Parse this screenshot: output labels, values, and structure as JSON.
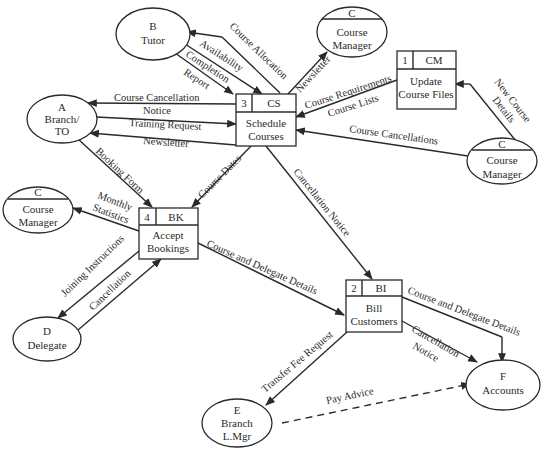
{
  "diagram": {
    "type": "data-flow-diagram",
    "colors": {
      "stroke": "#2a2a2a",
      "text": "#2a2a2a",
      "background": "#ffffff"
    },
    "processes": [
      {
        "id": "p1",
        "number": "1",
        "code": "CM",
        "line1": "Update",
        "line2": "Course Files"
      },
      {
        "id": "p2",
        "number": "2",
        "code": "BI",
        "line1": "Bill",
        "line2": "Customers"
      },
      {
        "id": "p3",
        "number": "3",
        "code": "CS",
        "line1": "Schedule",
        "line2": "Courses"
      },
      {
        "id": "p4",
        "number": "4",
        "code": "BK",
        "line1": "Accept",
        "line2": "Bookings"
      }
    ],
    "entities": {
      "tutor": {
        "letter": "B",
        "line1": "Tutor"
      },
      "branch_to": {
        "letter": "A",
        "line1": "Branch/",
        "line2": "TO"
      },
      "course_manager_top": {
        "letter": "C",
        "line1": "Course",
        "line2": "Manager"
      },
      "course_manager_right": {
        "letter": "C",
        "line1": "Course",
        "line2": "Manager"
      },
      "course_manager_left": {
        "letter": "C",
        "line1": "Course",
        "line2": "Manager"
      },
      "delegate": {
        "letter": "D",
        "line1": "Delegate"
      },
      "branch_lmgr": {
        "letter": "E",
        "line1": "Branch",
        "line2": "L.Mgr"
      },
      "accounts": {
        "letter": "F",
        "line1": "Accounts"
      }
    },
    "flows": {
      "course_allocation": "Course Allocation",
      "availability": "Availability",
      "completion": "Completion",
      "report": "Report",
      "newsletter_cm": "Newsletter",
      "course_cancellation": "Course Cancellation",
      "notice": "Notice",
      "training_request": "Training Request",
      "newsletter_branch": "Newsletter",
      "course_requirements": "Course Requirements",
      "course_lists": "Course Lists",
      "new_course": "New Course",
      "details": "Details",
      "course_cancellations": "Course Cancellations",
      "booking_form": "Booking Form",
      "course_dates": "Course Dates",
      "cancellation_notice_bi": "Cancellation Notice",
      "monthly": "Monthly",
      "statistics": "Statistics",
      "joining_instructions": "Joining Instructions",
      "cancellation": "Cancellation",
      "course_delegate_details_bk": "Course and Delegate Details",
      "course_delegate_details_acc": "Course and Delegate Details",
      "cancellation_acc": "Cancellation",
      "notice_acc": "Notice",
      "transfer_fee_request": "Transfer Fee Request",
      "pay_advice": "Pay Advice"
    }
  }
}
